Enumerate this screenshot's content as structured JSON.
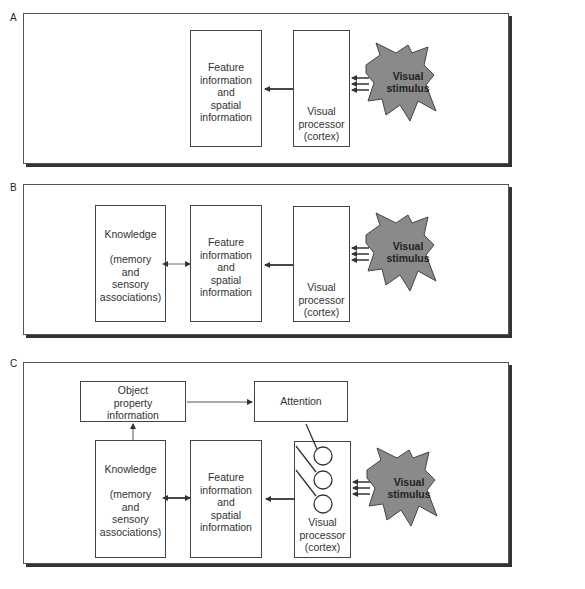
{
  "panels": [
    {
      "label": "A",
      "boxes": {
        "feature": "Feature\ninformation\nand\nspatial\ninformation",
        "visual_processor": "Visual\nprocessor\n(cortex)"
      },
      "stimulus": "Visual\nstimulus"
    },
    {
      "label": "B",
      "boxes": {
        "knowledge": "Knowledge\n\n(memory\nand\nsensory\nassociations)",
        "feature": "Feature\ninformation\nand\nspatial\ninformation",
        "visual_processor": "Visual\nprocessor\n(cortex)"
      },
      "stimulus": "Visual\nstimulus"
    },
    {
      "label": "C",
      "boxes": {
        "object_property": "Object\nproperty\ninformation",
        "attention": "Attention",
        "knowledge": "Knowledge\n\n(memory\nand\nsensory\nassociations)",
        "feature": "Feature\ninformation\nand\nspatial\ninformation",
        "visual_processor": "Visual\nprocessor\n(cortex)"
      },
      "stimulus": "Visual\nstimulus"
    }
  ],
  "colors": {
    "cloud_fill": "#8a8a8a",
    "line": "#333333",
    "shadow": "#333333"
  }
}
